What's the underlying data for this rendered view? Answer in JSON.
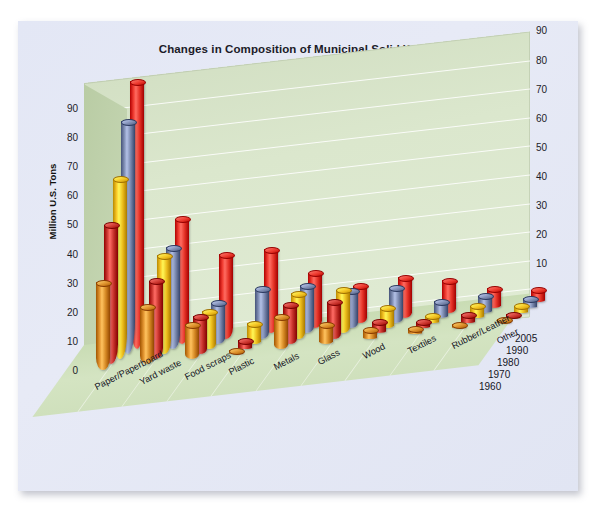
{
  "chart": {
    "title": "Changes in Composition of Municipal Solid Waste",
    "ylabel": "Million U.S. Tons"
  },
  "chart_data": {
    "type": "bar",
    "title": "Changes in Composition of Municipal Solid Waste",
    "subtitle": "",
    "xlabel": "",
    "ylabel": "Million U.S. Tons",
    "ylim": [
      0,
      90
    ],
    "yticks": [
      0,
      10,
      20,
      30,
      40,
      50,
      60,
      70,
      80,
      90
    ],
    "grid": true,
    "legend_position": "depth-axis-right",
    "projection": "3d-cylinder",
    "categories": [
      "Paper/Paperboard",
      "Yard waste",
      "Food scraps",
      "Plastic",
      "Metals",
      "Glass",
      "Wood",
      "Textiles",
      "Rubber/Leather",
      "Other"
    ],
    "series": [
      {
        "name": "1960",
        "color": "#d98c28",
        "values": [
          30,
          20,
          12,
          0.4,
          11,
          6.7,
          3.0,
          1.8,
          1.5,
          0.1
        ]
      },
      {
        "name": "1970",
        "color": "#c9352e",
        "values": [
          48,
          27,
          13,
          3.0,
          13.5,
          12.7,
          4.0,
          2.2,
          3.0,
          0.8
        ]
      },
      {
        "name": "1980",
        "color": "#f0c020",
        "values": [
          62,
          34,
          13,
          7.0,
          15.5,
          15.0,
          7.0,
          2.5,
          4.2,
          2.5
        ]
      },
      {
        "name": "1990",
        "color": "#7c8ab0",
        "values": [
          80,
          35,
          14,
          17.1,
          16.6,
          13.1,
          12.2,
          5.8,
          5.8,
          3.2
        ]
      },
      {
        "name": "2005",
        "color": "#e8352a",
        "values": [
          92,
          43,
          29,
          28.9,
          19.0,
          12.8,
          13.9,
          11.1,
          6.7,
          4.3
        ]
      }
    ],
    "depth_axis_labels": [
      "2005",
      "1990",
      "1980",
      "1970",
      "1960"
    ]
  }
}
